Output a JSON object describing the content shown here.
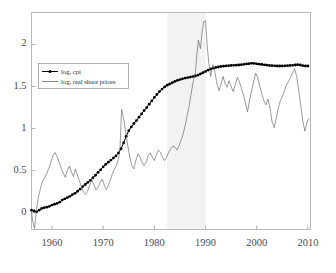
{
  "figure": {
    "background_color": "#ffffff",
    "frame_color": "#b9b9b9",
    "axis_text_color": "#4a4a4a"
  },
  "chart_data": {
    "type": "line",
    "title": "",
    "xlabel": "",
    "ylabel": "",
    "xlim": [
      1956,
      2010.5
    ],
    "ylim": [
      -0.2,
      2.38
    ],
    "xticks": [
      1960,
      1970,
      1980,
      1990,
      2000,
      2010
    ],
    "xtick_labels": [
      "1960",
      "1970",
      "1980",
      "1990",
      "2000",
      "2010"
    ],
    "yticks": [
      0,
      0.5,
      1,
      1.5,
      2
    ],
    "ytick_labels": [
      "0",
      "0.5",
      "1",
      "1.5",
      "2"
    ],
    "grid": false,
    "legend_position": "upper left",
    "shaded_regions": [
      {
        "name": "bubble-period",
        "x_start": 1982.5,
        "x_end": 1990.0,
        "color": "#f2f2f2"
      }
    ],
    "series": [
      {
        "name": "log, cpi",
        "label": "log, cpi",
        "color": "#000000",
        "line_width": 1.0,
        "marker": "dot",
        "x": [
          1956.0,
          1956.5,
          1957.0,
          1957.5,
          1958.0,
          1958.5,
          1959.0,
          1959.5,
          1960.0,
          1960.5,
          1961.0,
          1961.5,
          1962.0,
          1962.5,
          1963.0,
          1963.5,
          1964.0,
          1964.5,
          1965.0,
          1965.5,
          1966.0,
          1966.5,
          1967.0,
          1967.5,
          1968.0,
          1968.5,
          1969.0,
          1969.5,
          1970.0,
          1970.5,
          1971.0,
          1971.5,
          1972.0,
          1972.5,
          1973.0,
          1973.5,
          1974.0,
          1974.5,
          1975.0,
          1975.5,
          1976.0,
          1976.5,
          1977.0,
          1977.5,
          1978.0,
          1978.5,
          1979.0,
          1979.5,
          1980.0,
          1980.5,
          1981.0,
          1981.5,
          1982.0,
          1982.5,
          1983.0,
          1983.5,
          1984.0,
          1984.5,
          1985.0,
          1985.5,
          1986.0,
          1986.5,
          1987.0,
          1987.5,
          1988.0,
          1988.5,
          1989.0,
          1989.5,
          1990.0,
          1990.5,
          1991.0,
          1991.5,
          1992.0,
          1992.5,
          1993.0,
          1993.5,
          1994.0,
          1994.5,
          1995.0,
          1995.5,
          1996.0,
          1996.5,
          1997.0,
          1997.5,
          1998.0,
          1998.5,
          1999.0,
          1999.5,
          2000.0,
          2000.5,
          2001.0,
          2001.5,
          2002.0,
          2002.5,
          2003.0,
          2003.5,
          2004.0,
          2004.5,
          2005.0,
          2005.5,
          2006.0,
          2006.5,
          2007.0,
          2007.5,
          2008.0,
          2008.5,
          2009.0,
          2009.5,
          2010.0
        ],
        "y": [
          0.03,
          0.02,
          0.01,
          0.03,
          0.05,
          0.06,
          0.065,
          0.075,
          0.09,
          0.1,
          0.11,
          0.125,
          0.15,
          0.165,
          0.18,
          0.195,
          0.215,
          0.23,
          0.255,
          0.28,
          0.31,
          0.335,
          0.36,
          0.385,
          0.415,
          0.445,
          0.48,
          0.51,
          0.545,
          0.575,
          0.6,
          0.625,
          0.65,
          0.675,
          0.71,
          0.76,
          0.83,
          0.91,
          0.975,
          1.02,
          1.06,
          1.095,
          1.135,
          1.175,
          1.215,
          1.25,
          1.29,
          1.33,
          1.37,
          1.405,
          1.44,
          1.47,
          1.495,
          1.515,
          1.53,
          1.545,
          1.56,
          1.572,
          1.582,
          1.592,
          1.6,
          1.605,
          1.612,
          1.618,
          1.625,
          1.635,
          1.65,
          1.665,
          1.68,
          1.695,
          1.708,
          1.718,
          1.726,
          1.732,
          1.738,
          1.742,
          1.746,
          1.748,
          1.75,
          1.752,
          1.754,
          1.756,
          1.76,
          1.764,
          1.768,
          1.772,
          1.776,
          1.774,
          1.77,
          1.766,
          1.762,
          1.758,
          1.754,
          1.75,
          1.748,
          1.746,
          1.744,
          1.744,
          1.744,
          1.746,
          1.748,
          1.75,
          1.752,
          1.756,
          1.76,
          1.756,
          1.748,
          1.744,
          1.744
        ]
      },
      {
        "name": "log, real share prices",
        "label": "log, real share prices",
        "color": "#555555",
        "line_width": 0.6,
        "marker": "none",
        "x": [
          1956.0,
          1956.3,
          1956.6,
          1957.0,
          1957.4,
          1957.8,
          1958.2,
          1958.6,
          1959.0,
          1959.4,
          1959.8,
          1960.2,
          1960.6,
          1961.0,
          1961.4,
          1961.8,
          1962.2,
          1962.6,
          1963.0,
          1963.4,
          1963.8,
          1964.2,
          1964.6,
          1965.0,
          1965.4,
          1965.8,
          1966.2,
          1966.6,
          1967.0,
          1967.4,
          1967.8,
          1968.2,
          1968.6,
          1969.0,
          1969.4,
          1969.8,
          1970.2,
          1970.6,
          1971.0,
          1971.4,
          1971.8,
          1972.2,
          1972.6,
          1973.0,
          1973.3,
          1973.6,
          1974.0,
          1974.4,
          1974.8,
          1975.2,
          1975.6,
          1976.0,
          1976.4,
          1976.8,
          1977.2,
          1977.6,
          1978.0,
          1978.4,
          1978.8,
          1979.2,
          1979.6,
          1980.0,
          1980.4,
          1980.8,
          1981.2,
          1981.6,
          1982.0,
          1982.4,
          1982.8,
          1983.2,
          1983.6,
          1984.0,
          1984.4,
          1984.8,
          1985.2,
          1985.6,
          1986.0,
          1986.4,
          1986.8,
          1987.2,
          1987.6,
          1988.0,
          1988.3,
          1988.6,
          1989.0,
          1989.3,
          1989.6,
          1990.0,
          1990.3,
          1990.6,
          1991.0,
          1991.4,
          1991.8,
          1992.2,
          1992.6,
          1993.0,
          1993.4,
          1993.8,
          1994.2,
          1994.6,
          1995.0,
          1995.4,
          1995.8,
          1996.2,
          1996.6,
          1997.0,
          1997.4,
          1997.8,
          1998.2,
          1998.6,
          1999.0,
          1999.4,
          1999.8,
          2000.2,
          2000.6,
          2001.0,
          2001.4,
          2001.8,
          2002.2,
          2002.6,
          2003.0,
          2003.4,
          2003.8,
          2004.2,
          2004.6,
          2005.0,
          2005.4,
          2005.8,
          2006.2,
          2006.6,
          2007.0,
          2007.4,
          2007.8,
          2008.2,
          2008.6,
          2009.0,
          2009.4,
          2009.8,
          2010.2
        ],
        "y": [
          0.01,
          -0.12,
          -0.19,
          0.05,
          0.2,
          0.3,
          0.38,
          0.42,
          0.47,
          0.53,
          0.6,
          0.68,
          0.715,
          0.67,
          0.6,
          0.53,
          0.47,
          0.42,
          0.5,
          0.555,
          0.48,
          0.43,
          0.52,
          0.44,
          0.37,
          0.3,
          0.24,
          0.215,
          0.265,
          0.33,
          0.39,
          0.33,
          0.27,
          0.3,
          0.36,
          0.4,
          0.33,
          0.275,
          0.32,
          0.39,
          0.46,
          0.52,
          0.56,
          0.64,
          0.78,
          1.23,
          1.12,
          0.96,
          0.8,
          0.66,
          0.56,
          0.52,
          0.625,
          0.7,
          0.66,
          0.6,
          0.56,
          0.6,
          0.68,
          0.71,
          0.66,
          0.62,
          0.69,
          0.745,
          0.715,
          0.66,
          0.62,
          0.66,
          0.72,
          0.76,
          0.79,
          0.78,
          0.745,
          0.79,
          0.86,
          0.93,
          1.03,
          1.15,
          1.27,
          1.42,
          1.56,
          1.66,
          1.88,
          2.05,
          1.95,
          2.13,
          2.27,
          2.28,
          2.0,
          1.8,
          1.62,
          1.76,
          1.68,
          1.54,
          1.45,
          1.52,
          1.62,
          1.54,
          1.49,
          1.57,
          1.5,
          1.44,
          1.52,
          1.61,
          1.56,
          1.48,
          1.4,
          1.3,
          1.2,
          1.34,
          1.45,
          1.56,
          1.66,
          1.6,
          1.5,
          1.41,
          1.33,
          1.28,
          1.35,
          1.24,
          1.08,
          1.01,
          1.12,
          1.24,
          1.33,
          1.38,
          1.45,
          1.52,
          1.56,
          1.61,
          1.66,
          1.71,
          1.62,
          1.45,
          1.28,
          1.09,
          0.97,
          1.07,
          1.12
        ]
      }
    ]
  },
  "legend": {
    "entries": [
      {
        "label": "log, cpi",
        "style": "line-with-marker"
      },
      {
        "label": "log, real share prices",
        "style": "line"
      }
    ]
  }
}
